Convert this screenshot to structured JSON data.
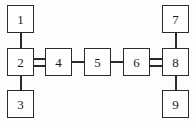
{
  "diagram": {
    "type": "block-diagram",
    "background_color": "#fdfdfd",
    "stroke_color": "#2b2b2b",
    "node_fill": "#ffffff",
    "node_count": 9,
    "edge_count": 8,
    "nodes": [
      {
        "id": "1",
        "label": "1",
        "x": 7,
        "y": 5,
        "w": 27,
        "h": 28
      },
      {
        "id": "2",
        "label": "2",
        "x": 7,
        "y": 48,
        "w": 27,
        "h": 28
      },
      {
        "id": "3",
        "label": "3",
        "x": 7,
        "y": 90,
        "w": 27,
        "h": 28
      },
      {
        "id": "4",
        "label": "4",
        "x": 45,
        "y": 48,
        "w": 27,
        "h": 28
      },
      {
        "id": "5",
        "label": "5",
        "x": 84,
        "y": 48,
        "w": 27,
        "h": 28
      },
      {
        "id": "6",
        "label": "6",
        "x": 123,
        "y": 48,
        "w": 27,
        "h": 28
      },
      {
        "id": "7",
        "label": "7",
        "x": 162,
        "y": 5,
        "w": 27,
        "h": 28
      },
      {
        "id": "8",
        "label": "8",
        "x": 162,
        "y": 48,
        "w": 27,
        "h": 28
      },
      {
        "id": "9",
        "label": "9",
        "x": 162,
        "y": 90,
        "w": 27,
        "h": 28
      }
    ],
    "edges": [
      {
        "id": "edge-1-2",
        "from": "1",
        "to": "2",
        "style": "single",
        "orientation": "vertical"
      },
      {
        "id": "edge-2-3",
        "from": "2",
        "to": "3",
        "style": "single",
        "orientation": "vertical"
      },
      {
        "id": "edge-2-4",
        "from": "2",
        "to": "4",
        "style": "double",
        "orientation": "horizontal"
      },
      {
        "id": "edge-4-5",
        "from": "4",
        "to": "5",
        "style": "single",
        "orientation": "horizontal"
      },
      {
        "id": "edge-5-6",
        "from": "5",
        "to": "6",
        "style": "single",
        "orientation": "horizontal"
      },
      {
        "id": "edge-6-8",
        "from": "6",
        "to": "8",
        "style": "double",
        "orientation": "horizontal"
      },
      {
        "id": "edge-7-8",
        "from": "7",
        "to": "8",
        "style": "single",
        "orientation": "vertical"
      },
      {
        "id": "edge-8-9",
        "from": "8",
        "to": "9",
        "style": "single",
        "orientation": "vertical"
      }
    ]
  }
}
